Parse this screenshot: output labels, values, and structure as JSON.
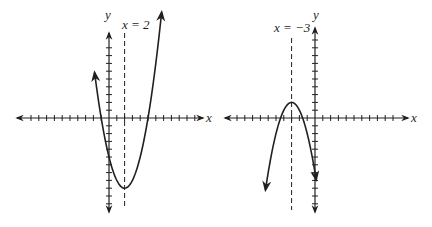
{
  "chart_data": [
    {
      "type": "line",
      "title": "",
      "xlabel": "x",
      "ylabel": "y",
      "equation": "y = (x - 2)^2 - 9",
      "axis_of_symmetry": {
        "label": "x = 2",
        "x": 2,
        "style": "dashed"
      },
      "vertex": [
        2,
        -9
      ],
      "roots": [
        -1,
        5
      ],
      "y_intercept": -5,
      "opens": "up",
      "xlim": [
        -12,
        12
      ],
      "ylim": [
        -10,
        11
      ],
      "grid": false,
      "tick_spacing": 1,
      "x": [
        -1.8,
        -1,
        0,
        1,
        2,
        3,
        4,
        5,
        6,
        6.8
      ],
      "values": [
        5.44,
        0,
        -5,
        -8,
        -9,
        -8,
        -5,
        0,
        7,
        14.04
      ]
    },
    {
      "type": "line",
      "title": "",
      "xlabel": "x",
      "ylabel": "y",
      "equation": "y = -(x + 3)^2 + 2",
      "axis_of_symmetry": {
        "label": "x = -3",
        "x": -3,
        "style": "dashed"
      },
      "vertex": [
        -3,
        2
      ],
      "roots": [
        -4.41,
        -1.59
      ],
      "opens": "down",
      "xlim": [
        -12,
        12
      ],
      "ylim": [
        -11,
        11
      ],
      "grid": false,
      "tick_spacing": 1,
      "x": [
        -6.4,
        -5,
        -4.41,
        -4,
        -3,
        -2,
        -1.59,
        -1,
        0,
        0.1
      ],
      "values": [
        -9.56,
        -2,
        0,
        1,
        2,
        1,
        0,
        -2,
        -7,
        -7.61
      ]
    }
  ],
  "graphs": {
    "left": {
      "x_label": "x",
      "y_label": "y",
      "symmetry_label": "x = 2"
    },
    "right": {
      "x_label": "x",
      "y_label": "y",
      "symmetry_label": "x = −3"
    }
  },
  "colors": {
    "ink": "#231f20",
    "background": "#ffffff"
  }
}
